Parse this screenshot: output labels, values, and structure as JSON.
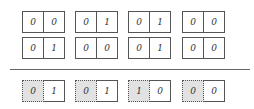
{
  "rows": [
    {
      "name": "input-row-1",
      "pairs": [
        [
          "0",
          "0"
        ],
        [
          "0",
          "1"
        ],
        [
          "0",
          "1"
        ],
        [
          "0",
          "0"
        ]
      ]
    },
    {
      "name": "input-row-2",
      "pairs": [
        [
          "0",
          "1"
        ],
        [
          "0",
          "0"
        ],
        [
          "0",
          "1"
        ],
        [
          "0",
          "0"
        ]
      ]
    },
    {
      "name": "result-row",
      "pairs": [
        [
          "0",
          "1"
        ],
        [
          "0",
          "1"
        ],
        [
          "1",
          "0"
        ],
        [
          "0",
          "0"
        ]
      ]
    }
  ],
  "colors": {
    "border": "#555555",
    "shaded": "#e2e2e2",
    "divider": "#666666"
  }
}
